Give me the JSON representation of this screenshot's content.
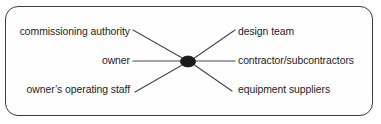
{
  "figure": {
    "kind": "hub-and-spoke-diagram",
    "center_node": {
      "name": "project-hub",
      "shape": "filled-ellipse",
      "label": ""
    },
    "colors": {
      "border": "#3b3b3b",
      "line": "#4a4a4a",
      "node": "#1a1a1a",
      "text": "#1c1c1c",
      "background": "#ffffff"
    },
    "left_labels": [
      {
        "id": "commissioning-authority",
        "text": "commissioning authority"
      },
      {
        "id": "owner",
        "text": "owner"
      },
      {
        "id": "owners-operating-staff",
        "text": "owner’s operating staff"
      }
    ],
    "right_labels": [
      {
        "id": "design-team",
        "text": "design team"
      },
      {
        "id": "contractor-subcontractors",
        "text": "contractor/subcontractors"
      },
      {
        "id": "equipment-suppliers",
        "text": "equipment suppliers"
      }
    ]
  }
}
